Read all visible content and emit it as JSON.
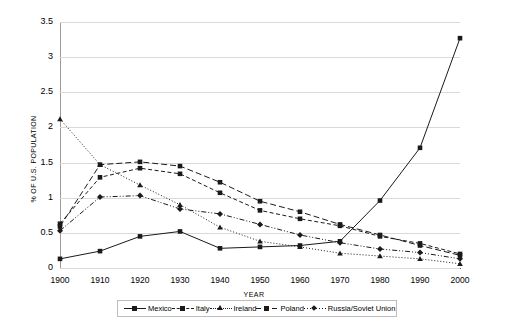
{
  "chart_data": {
    "type": "line",
    "title": "",
    "xlabel": "YEAR",
    "ylabel": "% OF U.S. POPULATION",
    "x": [
      1900,
      1910,
      1920,
      1930,
      1940,
      1950,
      1960,
      1970,
      1980,
      1990,
      2000
    ],
    "xtick_labels": [
      "1900",
      "1910",
      "1920",
      "1930",
      "1940",
      "1950",
      "1960",
      "1970",
      "1980",
      "1990",
      "2000"
    ],
    "ytick_labels": [
      "0",
      "0.5",
      "1",
      "1.5",
      "2",
      "2.5",
      "3",
      "3.5"
    ],
    "yticks": [
      0,
      0.5,
      1,
      1.5,
      2,
      2.5,
      3,
      3.5
    ],
    "ylim": [
      0,
      3.5
    ],
    "xlim": [
      1900,
      2000
    ],
    "grid": "horizontal",
    "legend_position": "bottom",
    "series": [
      {
        "name": "Mexico",
        "marker": "square",
        "linestyle": "solid",
        "color": "#1a1a1a",
        "values": [
          0.13,
          0.24,
          0.45,
          0.52,
          0.28,
          0.3,
          0.32,
          0.38,
          0.96,
          1.71,
          3.27
        ]
      },
      {
        "name": "Italy",
        "marker": "square",
        "linestyle": "dashed",
        "color": "#1a1a1a",
        "values": [
          0.63,
          1.29,
          1.42,
          1.34,
          1.07,
          0.82,
          0.7,
          0.6,
          0.45,
          0.35,
          0.2
        ]
      },
      {
        "name": "Ireland",
        "marker": "triangle",
        "linestyle": "dotted",
        "color": "#1a1a1a",
        "values": [
          2.12,
          1.47,
          1.18,
          0.9,
          0.58,
          0.38,
          0.3,
          0.21,
          0.17,
          0.13,
          0.06
        ]
      },
      {
        "name": "Poland",
        "marker": "square",
        "linestyle": "long-dash",
        "color": "#1a1a1a",
        "values": [
          0.59,
          1.47,
          1.51,
          1.45,
          1.22,
          0.95,
          0.8,
          0.62,
          0.47,
          0.32,
          0.18
        ]
      },
      {
        "name": "Russia/Soviet Union",
        "marker": "diamond",
        "linestyle": "dash-dot-dot",
        "color": "#1a1a1a",
        "values": [
          0.53,
          1.01,
          1.03,
          0.84,
          0.77,
          0.62,
          0.47,
          0.36,
          0.27,
          0.22,
          0.13
        ]
      }
    ]
  },
  "legend": {
    "items": [
      {
        "label": "Mexico",
        "style": "solid",
        "marker": "square"
      },
      {
        "label": "Italy",
        "style": "dash",
        "marker": "square"
      },
      {
        "label": "Ireland",
        "style": "dot",
        "marker": "tri"
      },
      {
        "label": "Poland",
        "style": "longdash",
        "marker": "square"
      },
      {
        "label": "Russia/Soviet Union",
        "style": "dashdotdot",
        "marker": "dia"
      }
    ]
  },
  "colors": {
    "ink": "#1a1a1a",
    "grid": "#d9d9d9",
    "axis": "#555555",
    "background": "#ffffff"
  }
}
